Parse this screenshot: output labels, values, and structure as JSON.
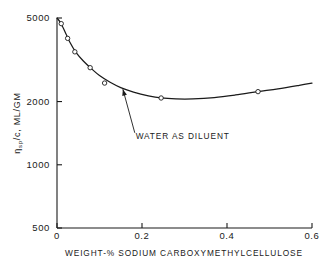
{
  "chart_data": {
    "type": "line",
    "title": "",
    "xlabel": "WEIGHT-% SODIUM CARBOXYMETHYLCELLULOSE",
    "ylabel": "ηsp/c,  ML/GM",
    "ylabel_parts": {
      "eta": "η",
      "sub": "sp",
      "rest": "/c,  ML/GM"
    },
    "xlim": [
      0,
      0.6
    ],
    "ylim": [
      500,
      5000
    ],
    "yscale": "log",
    "xscale": "linear",
    "grid": false,
    "legend": null,
    "xticks": [
      0,
      0.2,
      0.4,
      0.6
    ],
    "xticklabels": [
      "0",
      "0.2",
      "0.4",
      "0.6"
    ],
    "yticks": [
      500,
      1000,
      2000,
      5000
    ],
    "yticklabels": [
      "500",
      "1000",
      "2000",
      "5000"
    ],
    "series": [
      {
        "name": "Water as diluent",
        "marker": "open-circle",
        "x": [
          0.01,
          0.025,
          0.042,
          0.078,
          0.112,
          0.245,
          0.473
        ],
        "values": [
          4700,
          4000,
          3450,
          2900,
          2450,
          2080,
          2230
        ]
      }
    ],
    "curve_x": [
      0.0,
      0.008,
      0.018,
      0.03,
      0.045,
      0.062,
      0.08,
      0.1,
      0.125,
      0.15,
      0.18,
      0.215,
      0.245,
      0.28,
      0.32,
      0.37,
      0.42,
      0.473,
      0.52,
      0.57,
      0.6
    ],
    "curve_y": [
      5000,
      4760,
      4340,
      3840,
      3420,
      3120,
      2880,
      2660,
      2470,
      2330,
      2220,
      2130,
      2080,
      2060,
      2060,
      2090,
      2150,
      2230,
      2300,
      2390,
      2450
    ],
    "annotations": [
      {
        "text": "WATER AS DILUENT",
        "label_x": 0.185,
        "label_y": 1320,
        "arrow_from_x": 0.183,
        "arrow_from_y": 1420,
        "arrow_to_x": 0.155,
        "arrow_to_y": 2290
      }
    ]
  },
  "colors": {
    "ink": "#1a1a1a",
    "background": "#ffffff"
  }
}
